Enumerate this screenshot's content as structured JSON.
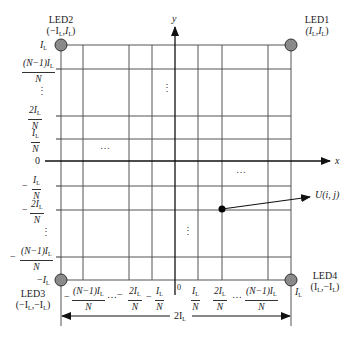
{
  "figure": {
    "type": "LED grid coordinate diagram",
    "axes": {
      "x_label": "x",
      "y_label": "y"
    },
    "leds": [
      {
        "name": "LED1",
        "coord": "(I_L, I_L)",
        "coord_display": "(I",
        "position": "top-right"
      },
      {
        "name": "LED2",
        "coord": "(−I_L, I_L)",
        "position": "top-left"
      },
      {
        "name": "LED3",
        "coord": "(−I_L, −I_L)",
        "position": "bottom-left"
      },
      {
        "name": "LED4",
        "coord": "(I_L, −I_L)",
        "position": "bottom-right"
      }
    ],
    "point": {
      "label": "U(i, j)"
    },
    "y_tick_labels": [
      "I_L",
      "(N−1)I_L/N",
      "⋮",
      "2I_L/N",
      "I_L/N",
      "0",
      "−I_L/N",
      "−2I_L/N",
      "⋮",
      "−(N−1)I_L/N",
      "−I_L"
    ],
    "x_tick_labels": [
      "−(N−1)I_L/N",
      "…",
      "−2I_L/N",
      "−I_L/N",
      "0",
      "I_L/N",
      "2I_L/N",
      "…",
      "(N−1)I_L/N",
      "I_L"
    ],
    "dimension_label": "2I_L",
    "ellipses": [
      "⋮",
      "…",
      "…",
      "⋮"
    ]
  },
  "text": {
    "led1": "LED1",
    "led2": "LED2",
    "led3": "LED3",
    "led4": "LED4",
    "axis_x": "x",
    "axis_y": "y",
    "I": "I",
    "L": "L",
    "N": "N",
    "zero": "0",
    "minus": "−",
    "num_N1": "(N−1)I",
    "num_2": "2I",
    "num_1": "I",
    "U_point": "U(i, j)",
    "dim_2": "2I",
    "hdots": "…",
    "vdots": "⋮",
    "led1_coord_open": "(I",
    "led1_coord_mid": ",I",
    "led1_coord_close": ")",
    "led2_coord_open": "(−I",
    "led2_coord_mid": ",I",
    "led2_coord_close": ")",
    "led3_coord_open": "(−I",
    "led3_coord_mid": ",−I",
    "led3_coord_close": ")",
    "led4_coord_open": "(I",
    "led4_coord_mid": ",−I",
    "led4_coord_close": ")"
  },
  "colors": {
    "grid": "#444444",
    "axis": "#111111",
    "led_fill": "#8a8a8a",
    "point": "#000000"
  }
}
